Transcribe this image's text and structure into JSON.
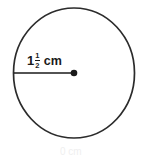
{
  "figure": {
    "type": "geometry-diagram",
    "shape": "circle",
    "background_color": "#ffffff",
    "stroke_color": "#2b2b2b",
    "text_color": "#1a1a1a",
    "circle": {
      "center_x": 74,
      "center_y": 73,
      "radius_x": 60.5,
      "radius_y": 65,
      "stroke_width": 1.6
    },
    "radius_segment": {
      "from_x": 14,
      "from_y": 73,
      "to_x": 74,
      "to_y": 73,
      "stroke_width": 1.6,
      "endpoint_dot_radius": 3.2
    },
    "label": {
      "whole": "1",
      "numerator": "1",
      "denominator": "2",
      "unit": "cm",
      "full_text": "1 1/2 cm"
    },
    "bottom_artifact": {
      "text": "0 cm"
    }
  }
}
